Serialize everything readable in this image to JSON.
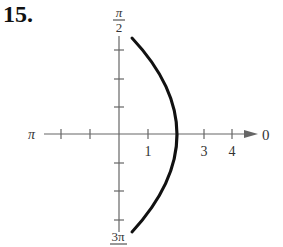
{
  "problem": {
    "number": "15."
  },
  "graph": {
    "type": "polar",
    "angle_labels": {
      "right": "0",
      "left": "π",
      "top": {
        "numerator": "π",
        "denominator": "2"
      },
      "bottom": {
        "numerator": "3π",
        "denominator": "2"
      }
    },
    "radial_tick_labels": [
      "1",
      "3",
      "4"
    ],
    "curve": {
      "description": "Arc crossing the polar axis at r = 2, opening to the left (vertical-line-like curve r = 2 sec θ style arc)",
      "color": "#111111"
    },
    "axis_color": "#555555"
  }
}
